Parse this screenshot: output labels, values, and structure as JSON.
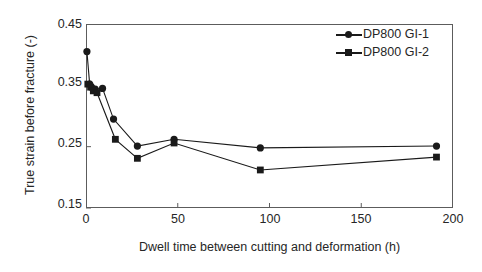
{
  "chart_data": {
    "type": "line",
    "title": "",
    "xlabel": "Dwell time between cutting and deformation (h)",
    "ylabel": "True strain before fracture (-)",
    "xlim": [
      0,
      200
    ],
    "ylim": [
      0.15,
      0.45
    ],
    "xticks": [
      0,
      50,
      100,
      150,
      200
    ],
    "yticks": [
      0.15,
      0.25,
      0.35,
      0.45
    ],
    "xtick_labels": [
      "0",
      "50",
      "100",
      "150",
      "200"
    ],
    "ytick_labels": [
      "0.15",
      "0.25",
      "0.35",
      "0.45"
    ],
    "grid": false,
    "legend_position": "top-right",
    "series": [
      {
        "name": "DP800 GI-1",
        "marker": "circle",
        "color": "#1a1a1a",
        "x": [
          0.5,
          2,
          3,
          5,
          9,
          15,
          28,
          48,
          95,
          191
        ],
        "y": [
          0.405,
          0.352,
          0.347,
          0.344,
          0.345,
          0.295,
          0.251,
          0.262,
          0.248,
          0.251
        ]
      },
      {
        "name": "DP800 GI-2",
        "marker": "square",
        "color": "#1a1a1a",
        "x": [
          1,
          2.5,
          4,
          6,
          16,
          28,
          48,
          95,
          191
        ],
        "y": [
          0.352,
          0.347,
          0.341,
          0.338,
          0.262,
          0.231,
          0.256,
          0.212,
          0.233
        ]
      }
    ]
  },
  "legend": {
    "entries": [
      {
        "label": "DP800 GI-1",
        "marker": "circle"
      },
      {
        "label": "DP800 GI-2",
        "marker": "square"
      }
    ]
  },
  "axes": {
    "x_title": "Dwell time between cutting and deformation (h)",
    "y_title": "True strain before fracture (-)",
    "x_tick_0": "0",
    "x_tick_1": "50",
    "x_tick_2": "100",
    "x_tick_3": "150",
    "x_tick_4": "200",
    "y_tick_0": "0.15",
    "y_tick_1": "0.25",
    "y_tick_2": "0.35",
    "y_tick_3": "0.45"
  },
  "colors": {
    "line": "#1a1a1a",
    "frame": "#5c5c5c",
    "text": "#262626",
    "background": "#ffffff"
  }
}
